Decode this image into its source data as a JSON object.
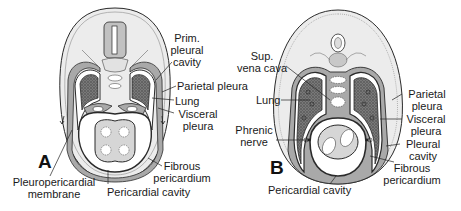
{
  "figure": {
    "panels": [
      {
        "id": "A",
        "letter": "A",
        "labels": {
          "prim_pleural_cavity": [
            "Prim.",
            "pleural",
            "cavity"
          ],
          "parietal_pleura": "Parietal pleura",
          "lung": "Lung",
          "visceral_pleura": [
            "Visceral",
            "pleura"
          ],
          "fibrous_pericardium": [
            "Fibrous",
            "pericardium"
          ],
          "pleuropericardial_membrane": [
            "Pleuropericardial",
            "membrane"
          ],
          "pericardial_cavity": "Pericardial cavity"
        }
      },
      {
        "id": "B",
        "letter": "B",
        "labels": {
          "sup_vena_cava": [
            "Sup.",
            "vena cava"
          ],
          "lung": "Lung",
          "phrenic_nerve": [
            "Phrenic",
            "nerve"
          ],
          "parietal_pleura": [
            "Parietal",
            "pleura"
          ],
          "visceral_pleura": [
            "Visceral",
            "pleura"
          ],
          "pleural_cavity": [
            "Pleural",
            "cavity"
          ],
          "fibrous_pericardium": [
            "Fibrous",
            "pericardium"
          ],
          "pericardial_cavity": "Pericardial cavity"
        }
      }
    ],
    "colors": {
      "outline": "#2a2a2a",
      "body_fill": "#ececec",
      "mesoderm_gray": "#a9a9a9",
      "lung_fill": "#6e6e6e",
      "heart_fill": "#d6d6d6",
      "cavity_fill": "#ffffff"
    }
  }
}
